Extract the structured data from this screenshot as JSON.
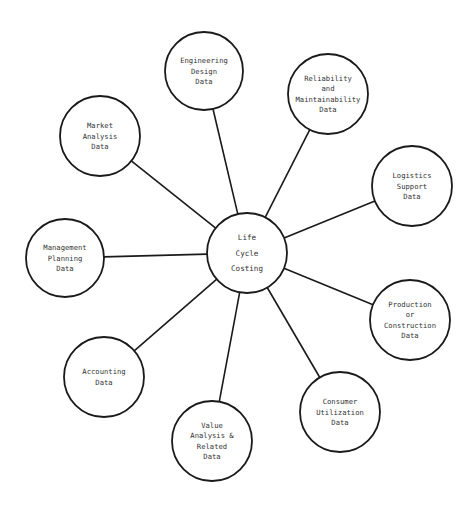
{
  "diagram": {
    "center": {
      "id": "life-cycle-costing",
      "lines": [
        "Life",
        "Cycle",
        "Costing"
      ]
    },
    "nodes": [
      {
        "id": "engineering-design-data",
        "lines": [
          "Engineering",
          "Design",
          "Data"
        ]
      },
      {
        "id": "reliability-maintainability-data",
        "lines": [
          "Reliability",
          "and",
          "Maintainability",
          "Data"
        ]
      },
      {
        "id": "logistics-support-data",
        "lines": [
          "Logistics",
          "Support",
          "Data"
        ]
      },
      {
        "id": "production-construction-data",
        "lines": [
          "Production",
          "or",
          "Construction",
          "Data"
        ]
      },
      {
        "id": "consumer-utilization-data",
        "lines": [
          "Consumer",
          "Utilization",
          "Data"
        ]
      },
      {
        "id": "value-analysis-related-data",
        "lines": [
          "Value",
          "Analysis &",
          "Related",
          "Data"
        ]
      },
      {
        "id": "accounting-data",
        "lines": [
          "Accounting",
          "Data"
        ]
      },
      {
        "id": "management-planning-data",
        "lines": [
          "Management",
          "Planning",
          "Data"
        ]
      },
      {
        "id": "market-analysis-data",
        "lines": [
          "Market",
          "Analysis",
          "Data"
        ]
      }
    ],
    "edges": [
      {
        "from": "life-cycle-costing",
        "to": "engineering-design-data"
      },
      {
        "from": "life-cycle-costing",
        "to": "reliability-maintainability-data"
      },
      {
        "from": "life-cycle-costing",
        "to": "logistics-support-data"
      },
      {
        "from": "life-cycle-costing",
        "to": "production-construction-data"
      },
      {
        "from": "life-cycle-costing",
        "to": "consumer-utilization-data"
      },
      {
        "from": "life-cycle-costing",
        "to": "value-analysis-related-data"
      },
      {
        "from": "life-cycle-costing",
        "to": "accounting-data"
      },
      {
        "from": "life-cycle-costing",
        "to": "management-planning-data"
      },
      {
        "from": "life-cycle-costing",
        "to": "market-analysis-data"
      }
    ]
  }
}
